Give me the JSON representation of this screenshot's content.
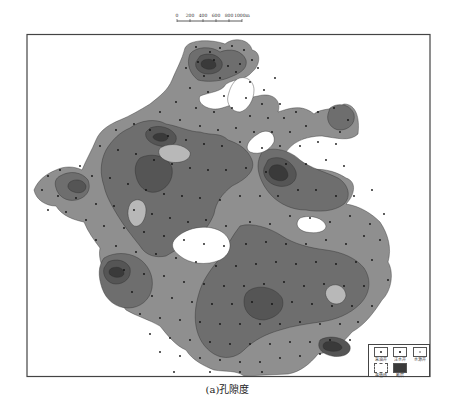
{
  "caption": "(a)孔隙度",
  "scale_bar": {
    "ticks": [
      "0",
      "200",
      "400",
      "600",
      "800",
      "1000m"
    ],
    "tick_x": [
      177,
      190,
      203,
      216,
      229,
      242
    ],
    "y": 19
  },
  "legend": {
    "items": [
      {
        "label": "采油井",
        "symbol": "dot"
      },
      {
        "label": "注水井",
        "symbol": "dot-small"
      },
      {
        "label": "水源井",
        "symbol": "dot-faint"
      },
      {
        "label": "等值线",
        "symbol": "contour-line"
      },
      {
        "label": "断层",
        "symbol": "dark-fill"
      }
    ]
  },
  "colors": {
    "frame": "#444444",
    "level1": "#8f8f8f",
    "level2": "#6e6e6e",
    "level3": "#555555",
    "level4": "#3a3a3a",
    "light": "#b8b8b8",
    "contour": "#2a2a2a",
    "well": "#111111"
  },
  "wells": [
    [
      196,
      47
    ],
    [
      210,
      52
    ],
    [
      220,
      48
    ],
    [
      232,
      46
    ],
    [
      244,
      50
    ],
    [
      198,
      62
    ],
    [
      214,
      60
    ],
    [
      228,
      66
    ],
    [
      240,
      64
    ],
    [
      186,
      68
    ],
    [
      204,
      76
    ],
    [
      220,
      78
    ],
    [
      236,
      72
    ],
    [
      252,
      60
    ],
    [
      258,
      68
    ],
    [
      250,
      82
    ],
    [
      264,
      90
    ],
    [
      275,
      78
    ],
    [
      190,
      88
    ],
    [
      208,
      92
    ],
    [
      224,
      96
    ],
    [
      246,
      98
    ],
    [
      262,
      104
    ],
    [
      280,
      104
    ],
    [
      176,
      102
    ],
    [
      196,
      108
    ],
    [
      214,
      112
    ],
    [
      232,
      108
    ],
    [
      250,
      116
    ],
    [
      268,
      118
    ],
    [
      284,
      118
    ],
    [
      296,
      112
    ],
    [
      160,
      112
    ],
    [
      180,
      120
    ],
    [
      200,
      126
    ],
    [
      218,
      130
    ],
    [
      236,
      128
    ],
    [
      254,
      132
    ],
    [
      272,
      132
    ],
    [
      290,
      132
    ],
    [
      306,
      126
    ],
    [
      318,
      112
    ],
    [
      334,
      108
    ],
    [
      348,
      120
    ],
    [
      340,
      132
    ],
    [
      116,
      130
    ],
    [
      134,
      124
    ],
    [
      150,
      130
    ],
    [
      168,
      136
    ],
    [
      186,
      140
    ],
    [
      204,
      144
    ],
    [
      222,
      146
    ],
    [
      240,
      142
    ],
    [
      262,
      148
    ],
    [
      280,
      146
    ],
    [
      300,
      146
    ],
    [
      318,
      142
    ],
    [
      336,
      144
    ],
    [
      100,
      146
    ],
    [
      118,
      150
    ],
    [
      136,
      154
    ],
    [
      154,
      160
    ],
    [
      172,
      164
    ],
    [
      190,
      168
    ],
    [
      208,
      170
    ],
    [
      226,
      170
    ],
    [
      246,
      168
    ],
    [
      266,
      172
    ],
    [
      286,
      164
    ],
    [
      306,
      164
    ],
    [
      326,
      160
    ],
    [
      344,
      166
    ],
    [
      80,
      166
    ],
    [
      60,
      170
    ],
    [
      48,
      176
    ],
    [
      92,
      176
    ],
    [
      110,
      178
    ],
    [
      128,
      184
    ],
    [
      146,
      190
    ],
    [
      164,
      194
    ],
    [
      182,
      196
    ],
    [
      200,
      198
    ],
    [
      220,
      200
    ],
    [
      240,
      196
    ],
    [
      260,
      196
    ],
    [
      278,
      196
    ],
    [
      298,
      190
    ],
    [
      316,
      190
    ],
    [
      336,
      196
    ],
    [
      354,
      196
    ],
    [
      372,
      190
    ],
    [
      42,
      190
    ],
    [
      58,
      196
    ],
    [
      76,
      198
    ],
    [
      96,
      204
    ],
    [
      114,
      206
    ],
    [
      134,
      210
    ],
    [
      152,
      214
    ],
    [
      170,
      218
    ],
    [
      188,
      222
    ],
    [
      206,
      220
    ],
    [
      226,
      226
    ],
    [
      250,
      222
    ],
    [
      270,
      224
    ],
    [
      290,
      216
    ],
    [
      310,
      218
    ],
    [
      330,
      222
    ],
    [
      350,
      216
    ],
    [
      370,
      224
    ],
    [
      384,
      214
    ],
    [
      48,
      210
    ],
    [
      66,
      212
    ],
    [
      86,
      220
    ],
    [
      104,
      226
    ],
    [
      124,
      228
    ],
    [
      144,
      232
    ],
    [
      164,
      236
    ],
    [
      184,
      240
    ],
    [
      204,
      244
    ],
    [
      224,
      246
    ],
    [
      246,
      244
    ],
    [
      266,
      242
    ],
    [
      286,
      244
    ],
    [
      306,
      244
    ],
    [
      326,
      240
    ],
    [
      346,
      244
    ],
    [
      364,
      236
    ],
    [
      380,
      240
    ],
    [
      96,
      240
    ],
    [
      116,
      246
    ],
    [
      136,
      252
    ],
    [
      156,
      254
    ],
    [
      176,
      258
    ],
    [
      196,
      262
    ],
    [
      216,
      266
    ],
    [
      236,
      266
    ],
    [
      256,
      264
    ],
    [
      276,
      262
    ],
    [
      296,
      264
    ],
    [
      316,
      262
    ],
    [
      336,
      264
    ],
    [
      356,
      262
    ],
    [
      372,
      260
    ],
    [
      124,
      270
    ],
    [
      144,
      274
    ],
    [
      164,
      276
    ],
    [
      184,
      282
    ],
    [
      204,
      284
    ],
    [
      224,
      286
    ],
    [
      244,
      286
    ],
    [
      264,
      284
    ],
    [
      284,
      282
    ],
    [
      304,
      286
    ],
    [
      324,
      284
    ],
    [
      344,
      286
    ],
    [
      364,
      286
    ],
    [
      388,
      280
    ],
    [
      132,
      292
    ],
    [
      152,
      296
    ],
    [
      172,
      298
    ],
    [
      192,
      302
    ],
    [
      212,
      304
    ],
    [
      232,
      304
    ],
    [
      252,
      302
    ],
    [
      272,
      304
    ],
    [
      292,
      302
    ],
    [
      312,
      304
    ],
    [
      332,
      306
    ],
    [
      352,
      306
    ],
    [
      372,
      306
    ],
    [
      140,
      314
    ],
    [
      160,
      318
    ],
    [
      180,
      320
    ],
    [
      200,
      322
    ],
    [
      220,
      324
    ],
    [
      240,
      324
    ],
    [
      260,
      324
    ],
    [
      280,
      324
    ],
    [
      300,
      322
    ],
    [
      320,
      324
    ],
    [
      340,
      324
    ],
    [
      358,
      322
    ],
    [
      150,
      334
    ],
    [
      170,
      338
    ],
    [
      190,
      340
    ],
    [
      210,
      342
    ],
    [
      230,
      344
    ],
    [
      250,
      344
    ],
    [
      270,
      344
    ],
    [
      290,
      342
    ],
    [
      310,
      342
    ],
    [
      330,
      340
    ],
    [
      350,
      340
    ],
    [
      160,
      352
    ],
    [
      180,
      356
    ],
    [
      200,
      358
    ],
    [
      220,
      360
    ],
    [
      240,
      362
    ],
    [
      260,
      362
    ],
    [
      280,
      358
    ],
    [
      300,
      356
    ],
    [
      320,
      354
    ],
    [
      210,
      372
    ],
    [
      240,
      372
    ],
    [
      262,
      372
    ],
    [
      174,
      372
    ]
  ]
}
